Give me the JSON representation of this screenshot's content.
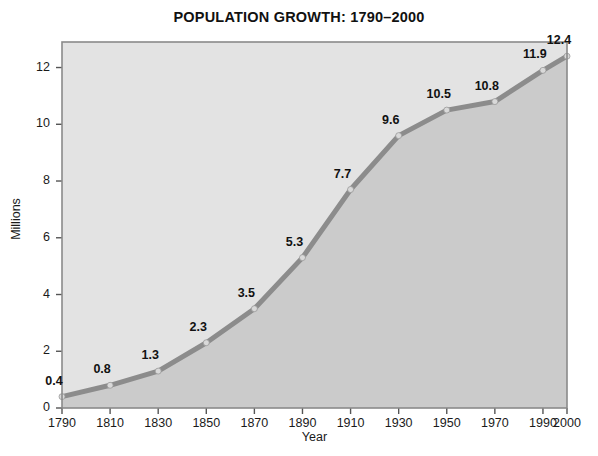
{
  "chart_data": {
    "type": "line",
    "title": "POPULATION GROWTH:  1790–2000",
    "xlabel": "Year",
    "ylabel": "Millions",
    "categories": [
      "1790",
      "1810",
      "1830",
      "1850",
      "1870",
      "1890",
      "1910",
      "1930",
      "1950",
      "1970",
      "1990",
      "2000"
    ],
    "values": [
      0.4,
      0.8,
      1.3,
      2.3,
      3.5,
      5.3,
      7.7,
      9.6,
      10.5,
      10.8,
      11.9,
      12.4
    ],
    "point_labels": [
      "0.4",
      "0.8",
      "1.3",
      "2.3",
      "3.5",
      "5.3",
      "7.7",
      "9.6",
      "10.5",
      "10.8",
      "11.9",
      "12.4"
    ],
    "ylim": [
      0,
      12.9
    ],
    "y_ticks": [
      "0",
      "2",
      "4",
      "6",
      "8",
      "10",
      "12"
    ],
    "y_tick_values": [
      0,
      2,
      4,
      6,
      8,
      10,
      12
    ],
    "grid": false,
    "legend": "none",
    "area_fill": true,
    "colors": {
      "line": "#8c8c8c",
      "marker": "#d9d9d9",
      "plot_background_upper": "#e3e3e3",
      "plot_area_fill_lower": "#cbcbcb",
      "frame": "#8a8a8a",
      "text": "#111111"
    }
  }
}
